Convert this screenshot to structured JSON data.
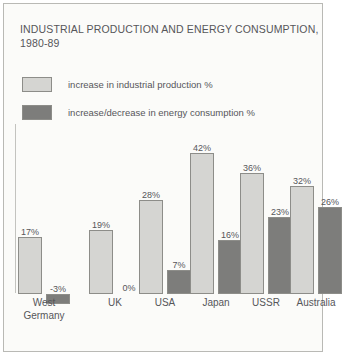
{
  "title": {
    "line1": "INDUSTRIAL PRODUCTION AND ENERGY CONSUMPTION,",
    "line2": "1980-89"
  },
  "legend": [
    {
      "label": "increase in industrial production %",
      "color": "#d5d5d2"
    },
    {
      "label": "increase/decrease in energy consumption %",
      "color": "#7d7d7b"
    }
  ],
  "colors": {
    "light_bar": "#d5d5d2",
    "dark_bar": "#7d7d7b",
    "bar_border": "#8d8d89",
    "text": "#56565a",
    "frame": "#b9b9b5",
    "background": "#fbfbf9"
  },
  "chart_data": {
    "type": "bar",
    "title": "INDUSTRIAL PRODUCTION AND ENERGY CONSUMPTION, 1980-89",
    "xlabel": "",
    "ylabel": "",
    "ylim": [
      -5,
      45
    ],
    "grid": false,
    "legend_position": "top-left",
    "categories": [
      "West Germany",
      "UK",
      "USA",
      "Japan",
      "USSR",
      "Australia"
    ],
    "series": [
      {
        "name": "increase in industrial production %",
        "color": "#d5d5d2",
        "values": [
          17,
          19,
          28,
          42,
          36,
          32
        ],
        "labels": [
          "17%",
          "19%",
          "28%",
          "42%",
          "36%",
          "32%"
        ]
      },
      {
        "name": "increase/decrease in energy consumption %",
        "color": "#7d7d7b",
        "values": [
          -3,
          0,
          7,
          16,
          23,
          26
        ],
        "labels": [
          "-3%",
          "0%",
          "7%",
          "16%",
          "23%",
          "26%"
        ]
      }
    ]
  },
  "categories_display": [
    {
      "line1": "West",
      "line2": "Germany"
    },
    {
      "line1": "UK",
      "line2": ""
    },
    {
      "line1": "USA",
      "line2": ""
    },
    {
      "line1": "Japan",
      "line2": ""
    },
    {
      "line1": "USSR",
      "line2": ""
    },
    {
      "line1": "Australia",
      "line2": ""
    }
  ]
}
